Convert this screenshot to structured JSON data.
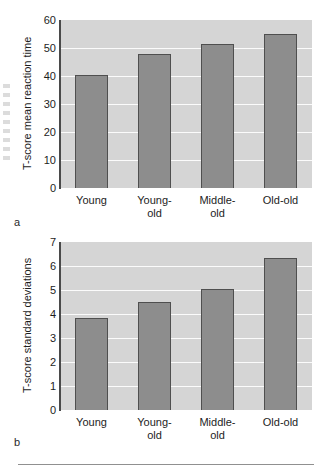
{
  "figure": {
    "panel_a_letter": "a",
    "panel_b_letter": "b",
    "bar_fill_color": "#8d8d8d",
    "bar_edge_color": "#4f4f4f",
    "plot_background_color": "#d5d5d5",
    "gridline_color": "#fbfbfb",
    "axis_color": "#4a4a4a"
  },
  "chart_data": [
    {
      "type": "bar",
      "panel": "a",
      "title": "",
      "xlabel": "",
      "ylabel": "T-score mean reaction time",
      "categories": [
        "Young",
        "Young-old",
        "Middle-old",
        "Old-old"
      ],
      "values": [
        40.2,
        47.8,
        51.5,
        55.1
      ],
      "ylim": [
        0,
        60
      ],
      "yticks": [
        0,
        10,
        20,
        30,
        40,
        50,
        60
      ],
      "ytick_labels": [
        "0",
        "10",
        "20",
        "30",
        "40",
        "50",
        "60"
      ],
      "grid": true,
      "legend": "none"
    },
    {
      "type": "bar",
      "panel": "b",
      "title": "",
      "xlabel": "",
      "ylabel": "T-score standard deviations",
      "categories": [
        "Young",
        "Young-old",
        "Middle-old",
        "Old-old"
      ],
      "values": [
        3.85,
        4.5,
        5.05,
        6.35
      ],
      "ylim": [
        0,
        7
      ],
      "yticks": [
        0,
        1,
        2,
        3,
        4,
        5,
        6,
        7
      ],
      "ytick_labels": [
        "0",
        "1",
        "2",
        "3",
        "4",
        "5",
        "6",
        "7"
      ],
      "grid": true,
      "legend": "none"
    }
  ],
  "category_lines": [
    [
      "Young"
    ],
    [
      "Young-",
      "old"
    ],
    [
      "Middle-",
      "old"
    ],
    [
      "Old-old"
    ]
  ]
}
